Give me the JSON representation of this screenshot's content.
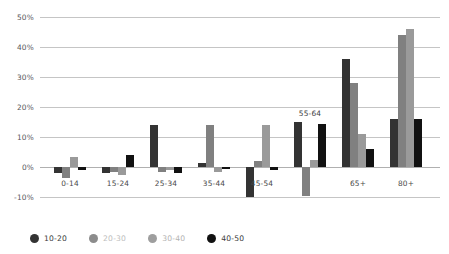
{
  "chart_data": {
    "type": "bar",
    "title": "",
    "xlabel": "",
    "ylabel": "",
    "ylim": [
      -10,
      50
    ],
    "grid": true,
    "legend_position": "bottom-left",
    "tick_suffix": "%",
    "yticks": [
      "50%",
      "40%",
      "30%",
      "20%",
      "10%",
      "0%",
      "-10%"
    ],
    "ytick_values": [
      50,
      40,
      30,
      20,
      10,
      0,
      -10
    ],
    "categories": [
      "0-14",
      "15-24",
      "25-34",
      "35-44",
      "45-54",
      "55-64",
      "65+",
      "80+"
    ],
    "series": [
      {
        "name": "10-20",
        "color": "#333333",
        "values": [
          -2,
          -2,
          14,
          1.5,
          -10,
          15,
          36,
          16
        ]
      },
      {
        "name": "20-30",
        "color": "#808080",
        "values": [
          -3.5,
          -1.5,
          -1.5,
          14,
          2,
          -9.5,
          28,
          44
        ]
      },
      {
        "name": "30-40",
        "color": "#9a9a9a",
        "values": [
          3.5,
          -2.5,
          -1,
          -1.5,
          14,
          2.5,
          11,
          46
        ]
      },
      {
        "name": "40-50",
        "color": "#111111",
        "values": [
          -1,
          4,
          -2,
          -0.5,
          -1,
          14.5,
          6,
          16
        ]
      }
    ]
  },
  "legend": {
    "items": [
      {
        "label": "10-20",
        "color": "#333333",
        "text_color": "#3a3a3a"
      },
      {
        "label": "20-30",
        "color": "#8c8c8c",
        "text_color": "#bdbdbd"
      },
      {
        "label": "30-40",
        "color": "#9e9e9e",
        "text_color": "#b2b2b2"
      },
      {
        "label": "40-50",
        "color": "#111111",
        "text_color": "#3a3a3a"
      }
    ]
  }
}
